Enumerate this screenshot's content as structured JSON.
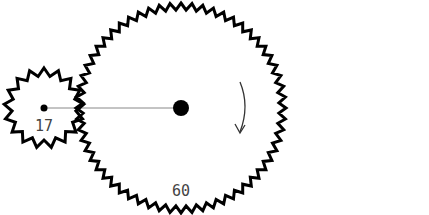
{
  "diagram": {
    "title": "",
    "gears": [
      {
        "id": "small",
        "teeth": 17,
        "label": "17",
        "cx": 44,
        "cy": 108,
        "r_outer": 40,
        "r_inner": 32,
        "hub_r": 3.5
      },
      {
        "id": "large",
        "teeth": 60,
        "label": "60",
        "cx": 181,
        "cy": 108,
        "r_outer": 105,
        "r_inner": 98,
        "hub_r": 8
      }
    ],
    "connector": {
      "from": "small",
      "to": "large",
      "color": "#888888"
    },
    "rotation_arrow": {
      "gear": "large",
      "direction": "clockwise"
    },
    "colors": {
      "stroke": "#000000",
      "label": "#444444",
      "background": "#ffffff"
    }
  }
}
